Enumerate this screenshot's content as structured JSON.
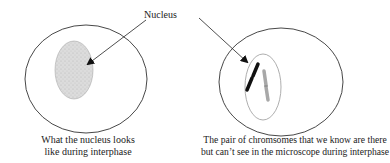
{
  "diagram": {
    "nucleus_label": "Nucleus",
    "left_panel": {
      "caption_line1": "What the nucleus looks",
      "caption_line2": "like during interphase"
    },
    "right_panel": {
      "caption_line1": "The pair of chromsomes that we know are there",
      "caption_line2": "but can’t see in the microscope during interphase"
    },
    "colors": {
      "outline": "#333333",
      "nucleus_fill": "#d8d8d8",
      "chromosome_dark": "#111111",
      "chromosome_light": "#a8a8a8"
    }
  }
}
